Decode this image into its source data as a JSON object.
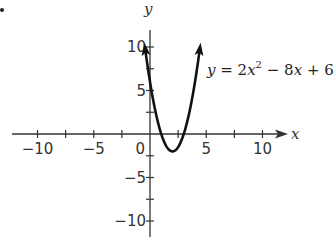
{
  "chart_data": {
    "type": "line",
    "title": "",
    "function": "y = 2x^2 - 8x + 6",
    "equation_label": {
      "prefix": "y",
      "eq": " = 2",
      "var": "x",
      "exp": "2",
      "rest1": " − 8",
      "var2": "x",
      "rest2": " + 6"
    },
    "xlabel": "x",
    "ylabel": "y",
    "xlim": [
      -11,
      12
    ],
    "ylim": [
      -11,
      12
    ],
    "x_ticks": [
      -10,
      -7.5,
      -5,
      -2.5,
      2.5,
      5,
      7.5,
      10
    ],
    "y_ticks": [
      -10,
      -7.5,
      -5,
      -2.5,
      2.5,
      5,
      7.5,
      10
    ],
    "x_tick_labels": [
      {
        "value": -10,
        "label": "−10"
      },
      {
        "value": -5,
        "label": "−5"
      },
      {
        "value": 0,
        "label": "0"
      },
      {
        "value": 5,
        "label": "5"
      },
      {
        "value": 10,
        "label": "10"
      }
    ],
    "y_tick_labels": [
      {
        "value": 10,
        "label": "10"
      },
      {
        "value": 5,
        "label": "5"
      },
      {
        "value": -5,
        "label": "−5"
      },
      {
        "value": -10,
        "label": "−10"
      }
    ],
    "vertex": [
      2,
      -2
    ],
    "x_intercepts": [
      1,
      3
    ],
    "y_intercept": 6,
    "grid": false,
    "series": [
      {
        "name": "y = 2x^2 - 8x + 6",
        "color": "#111111"
      }
    ]
  },
  "axes": {
    "origin_px": [
      150,
      134
    ],
    "px_per_unit_x": 11.25,
    "px_per_unit_y": 8.7
  },
  "colors": {
    "axis": "#333333",
    "curve": "#111111",
    "text": "#333333"
  }
}
